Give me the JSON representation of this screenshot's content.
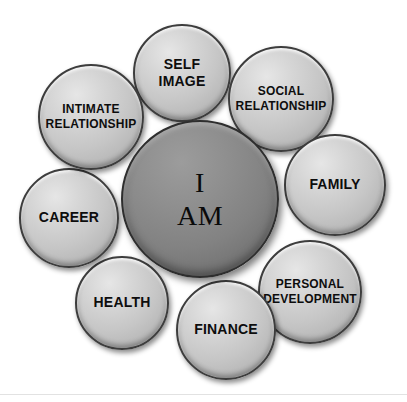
{
  "diagram": {
    "background_color": "#ffffff",
    "center": {
      "id": "i-am",
      "label": "I\nAM",
      "line1": "I",
      "line2": "AM",
      "fill_color": "#828282",
      "border_color": "#2e2e2e",
      "text_color": "#0a0a0a",
      "cx": 200,
      "cy": 199,
      "r": 79
    },
    "satellite_fill_color": "#c8c8c8",
    "satellite_border_color": "#3d3d3d",
    "satellite_text_color": "#0d0d0d",
    "satellites": [
      {
        "id": "self-image",
        "label": "SELF IMAGE",
        "line1": "SELF",
        "line2": "IMAGE",
        "cx": 182,
        "cy": 73,
        "r": 49,
        "font_size": 14
      },
      {
        "id": "social-relationship",
        "label": "SOCIAL RELATIONSHIP",
        "line1": "SOCIAL",
        "line2": "RELATIONSHIP",
        "cx": 281,
        "cy": 99,
        "r": 53,
        "font_size": 12
      },
      {
        "id": "family",
        "label": "FAMILY",
        "line1": "FAMILY",
        "line2": "",
        "cx": 335,
        "cy": 185,
        "r": 51,
        "font_size": 14
      },
      {
        "id": "personal-development",
        "label": "PERSONAL DEVELOPMENT",
        "line1": "PERSONAL",
        "line2": "DEVELOPMENT",
        "cx": 310,
        "cy": 292,
        "r": 52,
        "font_size": 12
      },
      {
        "id": "finance",
        "label": "FINANCE",
        "line1": "FINANCE",
        "line2": "",
        "cx": 226,
        "cy": 330,
        "r": 50,
        "font_size": 14
      },
      {
        "id": "health",
        "label": "HEALTH",
        "line1": "HEALTH",
        "line2": "",
        "cx": 122,
        "cy": 303,
        "r": 47,
        "font_size": 14
      },
      {
        "id": "career",
        "label": "CAREER",
        "line1": "CAREER",
        "line2": "",
        "cx": 69,
        "cy": 218,
        "r": 50,
        "font_size": 14
      },
      {
        "id": "intimate-relationship",
        "label": "INTIMATE RELATIONSHIP",
        "line1": "INTIMATE",
        "line2": "RELATIONSHIP",
        "cx": 91,
        "cy": 117,
        "r": 53,
        "font_size": 12
      }
    ]
  }
}
